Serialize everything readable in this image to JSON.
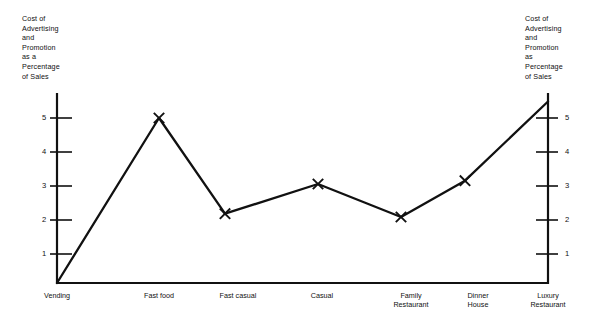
{
  "chart_data": {
    "type": "line",
    "title": "",
    "subtitle": "",
    "ylabel_left": "Cost of\nAdvertising\nand\nPromotion\nas a\nPercentage\nof Sales",
    "ylabel_right": "Cost of\nAdvertising\nand\nPromotion\nas\nPercentage\nof Sales",
    "xlabel": "",
    "categories": [
      "Vending",
      "Fast food",
      "Fast casual",
      "Casual",
      "Family\nRestaurant",
      "Dinner\nHouse",
      "Luxury\nRestaurant"
    ],
    "values": [
      0,
      5.0,
      2.1,
      3.0,
      2.0,
      3.1,
      5.5
    ],
    "ylim": [
      0,
      5.6
    ],
    "yticks": [
      1,
      2,
      3,
      4,
      5
    ],
    "ytick_labels_left": [
      "1",
      "2",
      "3",
      "4",
      "5"
    ],
    "ytick_labels_right": [
      "1",
      "2",
      "3",
      "4",
      "5"
    ],
    "grid": false,
    "legend": "none",
    "marker": "x",
    "line_color": "#111111",
    "axis_color": "#111111",
    "background": "#ffffff"
  },
  "axes": {
    "left_title": "Cost of\nAdvertising\nand\nPromotion\nas a\nPercentage\nof Sales",
    "right_title": "Cost of\nAdvertising\nand\nPromotion\nas\nPercentage\nof Sales"
  },
  "ticks": {
    "left": [
      {
        "label": "5"
      },
      {
        "label": "4"
      },
      {
        "label": "3"
      },
      {
        "label": "2"
      },
      {
        "label": "1"
      }
    ],
    "right": [
      {
        "label": "5"
      },
      {
        "label": "4"
      },
      {
        "label": "3"
      },
      {
        "label": "2"
      },
      {
        "label": "1"
      }
    ]
  },
  "categories": [
    {
      "label": "Vending"
    },
    {
      "label": "Fast food"
    },
    {
      "label": "Fast casual"
    },
    {
      "label": "Casual"
    },
    {
      "label": "Family\nRestaurant"
    },
    {
      "label": "Dinner\nHouse"
    },
    {
      "label": "Luxury\nRestaurant"
    }
  ]
}
